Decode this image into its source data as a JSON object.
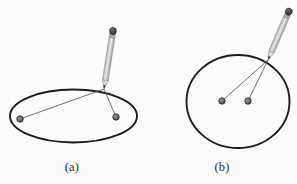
{
  "figure": {
    "background_color": "#fcfcfc",
    "ink_color": "#231f20",
    "curve_color": "#1b1b1b",
    "string_color": "#5a5a5a",
    "pin_head_color": "#6e6e6e",
    "pin_head_outline": "#2a2a2a",
    "pencil_body_color": "#c9c9c9",
    "pencil_body_shade": "#9a9a9a",
    "pencil_body_highlight": "#e6e6e6",
    "pencil_eraser_color": "#4a4a4a",
    "pencil_tip_color": "#3a3a3a"
  },
  "panels": [
    {
      "id": "a",
      "caption": "(a)",
      "curve": {
        "shape": "ellipse",
        "center_x": 73.5,
        "center_y": 116,
        "radius_x": 63.5,
        "radius_y": 26.5,
        "stroke_width": 1.9
      },
      "foci": [
        {
          "name": "left-pin",
          "x": 20,
          "y": 119,
          "radius": 3.2
        },
        {
          "name": "right-pin",
          "x": 116,
          "y": 117,
          "radius": 3.2
        }
      ],
      "pencil": {
        "tip_x": 104,
        "tip_y": 89,
        "top_x": 113,
        "top_y": 31,
        "width": 5.6,
        "eraser_length": 7
      },
      "strings": [
        {
          "name": "string-to-left-pin",
          "x1": 104,
          "y1": 89,
          "x2": 20,
          "y2": 119
        },
        {
          "name": "string-to-right-pin",
          "x1": 104,
          "y1": 89,
          "x2": 116,
          "y2": 117
        }
      ]
    },
    {
      "id": "b",
      "caption": "(b)",
      "curve": {
        "shape": "circle",
        "center_x": 238,
        "center_y": 101.5,
        "radius_x": 51.5,
        "radius_y": 46.5,
        "stroke_width": 1.9
      },
      "foci": [
        {
          "name": "left-pin",
          "x": 222,
          "y": 101,
          "radius": 3.2
        },
        {
          "name": "right-pin",
          "x": 248,
          "y": 101,
          "radius": 3.2
        }
      ],
      "pencil": {
        "tip_x": 268,
        "tip_y": 60,
        "top_x": 289,
        "top_y": 11,
        "width": 5.6,
        "eraser_length": 7
      },
      "strings": [
        {
          "name": "string-to-left-pin",
          "x1": 268,
          "y1": 60,
          "x2": 222,
          "y2": 101
        },
        {
          "name": "string-to-right-pin",
          "x1": 268,
          "y1": 60,
          "x2": 248,
          "y2": 101
        }
      ]
    }
  ]
}
